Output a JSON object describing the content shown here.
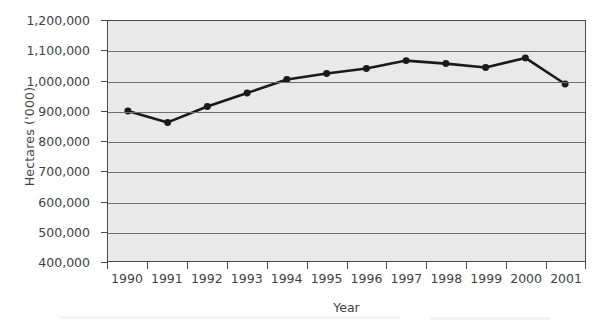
{
  "chart_data": {
    "type": "line",
    "title": "",
    "subtitle": "",
    "xlabel": "Year",
    "ylabel": "Hectares ('000)",
    "categories": [
      "1990",
      "1991",
      "1992",
      "1993",
      "1994",
      "1995",
      "1996",
      "1997",
      "1998",
      "1999",
      "2000",
      "2001"
    ],
    "x": [
      1990,
      1991,
      1992,
      1993,
      1994,
      1995,
      1996,
      1997,
      1998,
      1999,
      2000,
      2001
    ],
    "series": [
      {
        "name": "Hectares",
        "values": [
          900000,
          862000,
          915000,
          960000,
          1005000,
          1025000,
          1042000,
          1068000,
          1058000,
          1045000,
          1077000,
          990000
        ]
      }
    ],
    "ylim": [
      400000,
      1200000
    ],
    "ytick_values": [
      1200000,
      1100000,
      1000000,
      900000,
      800000,
      700000,
      600000,
      500000,
      400000
    ],
    "ytick_labels": [
      "1,200,000",
      "1,100,000",
      "1,000,000",
      "900,000",
      "800,000",
      "700,000",
      "600,000",
      "500,000",
      "400,000"
    ],
    "xtick_labels": [
      "1990",
      "1991",
      "1992",
      "1993",
      "1994",
      "1995",
      "1996",
      "1997",
      "1998",
      "1999",
      "2000",
      "2001"
    ],
    "grid": true,
    "grid_axis": "y",
    "legend": false,
    "legend_position": "none",
    "marker": "circle",
    "marker_size": 7,
    "line_width": 2.6,
    "colors": {
      "line": "#1a1a1a",
      "marker": "#1a1a1a",
      "plot_background": "#e9e9e9",
      "gridline": "#6e6e6e",
      "axis": "#4a4a4a",
      "text": "#3f3f3f",
      "page_background": "#ffffff"
    }
  }
}
